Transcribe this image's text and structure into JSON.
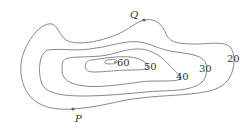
{
  "diagram": {
    "type": "contour-map",
    "contours": [
      {
        "level": "20",
        "label": "20"
      },
      {
        "level": "30",
        "label": "30"
      },
      {
        "level": "40",
        "label": "40"
      },
      {
        "level": "50",
        "label": "50"
      },
      {
        "level": "60",
        "label": "60"
      }
    ],
    "points": [
      {
        "name": "Q",
        "label": "Q",
        "on_contour": "20"
      },
      {
        "name": "P",
        "label": "P",
        "on_contour": "20"
      }
    ],
    "colors": {
      "line": "#7a7a7a",
      "text": "#333333",
      "point": "#666666"
    }
  }
}
